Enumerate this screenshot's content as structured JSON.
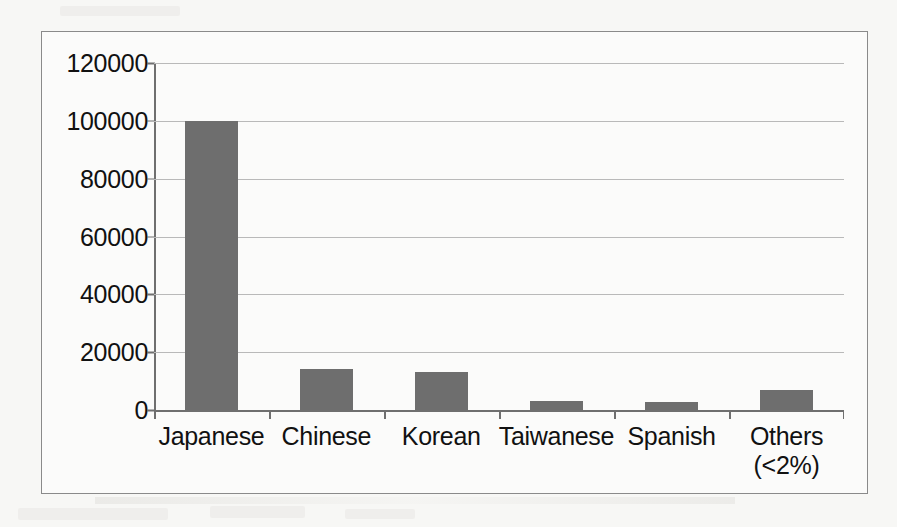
{
  "chart_data": {
    "type": "bar",
    "title": "",
    "subtitle": "",
    "xlabel": "",
    "ylabel": "",
    "categories": [
      "Japanese",
      "Chinese",
      "Korean",
      "Taiwanese",
      "Spanish",
      "Others"
    ],
    "category_sublabels": [
      "",
      "",
      "",
      "",
      "",
      "(<2%)"
    ],
    "values": [
      100000,
      14300,
      13200,
      3000,
      2700,
      7000
    ],
    "ylim": [
      0,
      120000
    ],
    "ytick_labels": [
      "120000",
      "100000",
      "80000",
      "60000",
      "40000",
      "20000",
      "0"
    ],
    "ytick_values": [
      120000,
      100000,
      80000,
      60000,
      40000,
      20000,
      0
    ],
    "grid": "horizontal",
    "legend": "none",
    "bar_color": "#6e6e6e",
    "gridline_color": "#b9b9b9",
    "axis_color": "#6f6f6f",
    "frame_color": "#8a8a8a",
    "background_color": "#f7f7f5",
    "plot_background_color": "#fbfbfa"
  }
}
